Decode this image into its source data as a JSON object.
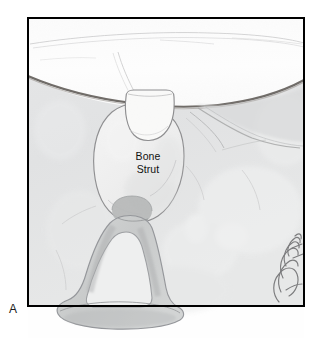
{
  "figure": {
    "panel_label": "A",
    "title_text": "Bone Strut",
    "caption_lines": [
      "Bone",
      "Strut"
    ],
    "medium": "pencil-and-wash medical illustration",
    "frame": {
      "border_color": "#000000",
      "border_width_px": 2,
      "x": 27,
      "y": 17,
      "width": 278,
      "height": 290
    },
    "palette": {
      "page_background": "#ffffff",
      "frame_border": "#000000",
      "tissue_background": "#e2e3e4",
      "tissue_background_light": "#eceded",
      "white_cavity": "#fdfdfd",
      "cavity_edge_arc": "#6b6763",
      "pencil_outline": "#9a9a9c",
      "pencil_outline_dark": "#7c7b7d",
      "graft_fill": "#f2f2f2",
      "graft_wedge_fill": "#f7f7f6",
      "stapes_fill": "#cfd1d1",
      "stapes_fill_dark": "#b9bbbb",
      "stapes_lumen": "#eeefef",
      "stapes_head": "#b4b6b6",
      "ligament_shade": "#cdcecd",
      "label_text": "#111111",
      "panel_label_text": "#1a1a1a",
      "signature_ink": "#6f6f71"
    }
  },
  "anatomy": {
    "structures": [
      {
        "name": "tympanic-cavity-space",
        "label": "",
        "description": "large white dome-shaped cavity across the upper third"
      },
      {
        "name": "cavity-boundary-arc",
        "label": "",
        "description": "dark curved bony arc bounding the white cavity below"
      },
      {
        "name": "bone-strut-graft",
        "label": "Bone Strut",
        "description": "oval pencil-outlined bone graft columella spanning from the cavity roof down to the stapes head"
      },
      {
        "name": "graft-superior-wedge",
        "label": "",
        "description": "light trapezoidal notched top of the graft seated against the cavity roof"
      },
      {
        "name": "stapes",
        "label": "",
        "description": "stirrup-shaped ossicle with anterior and posterior crura and a footplate base"
      },
      {
        "name": "stapes-head",
        "label": "",
        "description": "darker rounded capitulum where the bone strut seats"
      },
      {
        "name": "stapes-footplate",
        "label": "",
        "description": "wide flared base extending past the lower frame border"
      },
      {
        "name": "lateral-ligament-fold",
        "label": "",
        "description": "diagonal shaded mucosal fold sweeping to the upper right corner"
      }
    ]
  },
  "signature": {
    "present": true,
    "description": "artist cursive signature, lower right inside frame",
    "name": "signature-mark"
  }
}
